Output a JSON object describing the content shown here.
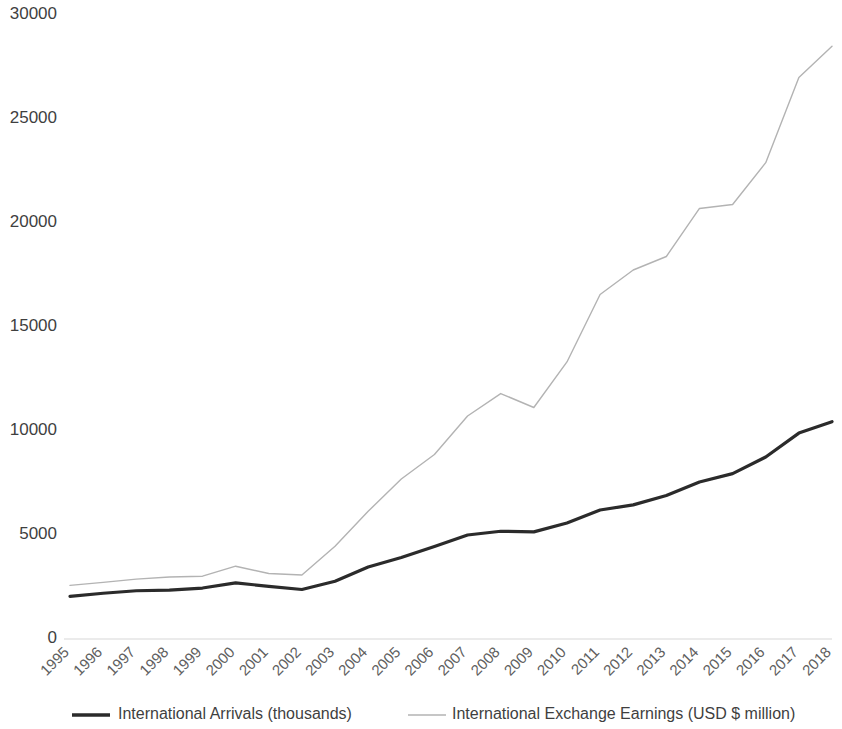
{
  "chart_data": {
    "type": "line",
    "title": "",
    "subtitle": "",
    "xlabel": "",
    "ylabel": "",
    "grid": false,
    "legend_position": "bottom",
    "ylim": [
      0,
      30000
    ],
    "ytick_labels": [
      "0",
      "5000",
      "10000",
      "15000",
      "20000",
      "25000",
      "30000"
    ],
    "ytick_values": [
      0,
      5000,
      10000,
      15000,
      20000,
      25000,
      30000
    ],
    "categories": [
      "1995",
      "1996",
      "1997",
      "1998",
      "1999",
      "2000",
      "2001",
      "2002",
      "2003",
      "2004",
      "2005",
      "2006",
      "2007",
      "2008",
      "2009",
      "2010",
      "2011",
      "2012",
      "2013",
      "2014",
      "2015",
      "2016",
      "2017",
      "2018"
    ],
    "series": [
      {
        "name": "International Arrivals (thousands)",
        "color": "#2b2b2b",
        "width": 3.2,
        "values": [
          2050,
          2200,
          2320,
          2350,
          2450,
          2700,
          2530,
          2380,
          2780,
          3460,
          3920,
          4450,
          5000,
          5180,
          5150,
          5580,
          6200,
          6450,
          6900,
          7550,
          7950,
          8750,
          9900,
          10450
        ]
      },
      {
        "name": "International Exchange Earnings (USD $ million)",
        "color": "#b3b3b3",
        "width": 1.4,
        "values": [
          2580,
          2720,
          2880,
          2980,
          3020,
          3500,
          3150,
          3080,
          4460,
          6140,
          7690,
          8870,
          10720,
          11800,
          11130,
          13320,
          16560,
          17740,
          18390,
          20700,
          20890,
          22900,
          27000,
          28500
        ]
      }
    ]
  },
  "axes": {
    "plot_left": 70,
    "plot_right": 832,
    "plot_top": 15,
    "plot_bottom": 639
  },
  "legend": {
    "items": [
      {
        "label": "International Arrivals (thousands)",
        "color": "#2b2b2b",
        "width": 3.4,
        "swatch_x": 72,
        "text_x": 118
      },
      {
        "label": "International Exchange Earnings (USD $ million)",
        "color": "#b3b3b3",
        "width": 1.5,
        "swatch_x": 408,
        "text_x": 452
      }
    ],
    "y": 715
  }
}
